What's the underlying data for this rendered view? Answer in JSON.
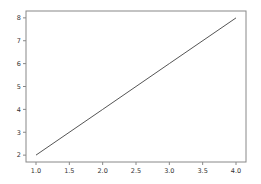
{
  "chart_data": {
    "type": "line",
    "title": "",
    "xlabel": "",
    "ylabel": "",
    "x": [
      1.0,
      2.0,
      3.0,
      4.0
    ],
    "series": [
      {
        "name": "line",
        "values": [
          2,
          4,
          6,
          8
        ],
        "color": "#555555"
      }
    ],
    "xlim": [
      0.85,
      4.15
    ],
    "ylim": [
      1.7,
      8.3
    ],
    "xticks": [
      1.0,
      1.5,
      2.0,
      2.5,
      3.0,
      3.5,
      4.0
    ],
    "xtick_labels": [
      "1.0",
      "1.5",
      "2.0",
      "2.5",
      "3.0",
      "3.5",
      "4.0"
    ],
    "yticks": [
      2,
      3,
      4,
      5,
      6,
      7,
      8
    ],
    "ytick_labels": [
      "2",
      "3",
      "4",
      "5",
      "6",
      "7",
      "8"
    ],
    "grid": false,
    "legend": null
  },
  "style": {
    "axes_color": "#888888",
    "text_color": "#333333",
    "background": "#ffffff"
  }
}
